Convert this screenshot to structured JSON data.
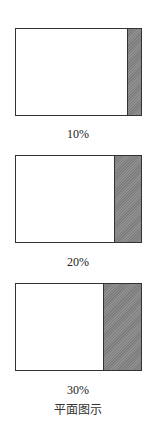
{
  "figure": {
    "caption": "平面图示",
    "panels": [
      {
        "label": "10%",
        "percent": 10
      },
      {
        "label": "20%",
        "percent": 20
      },
      {
        "label": "30%",
        "percent": 30
      }
    ],
    "colors": {
      "border": "#333333",
      "shade": "#8a8a8a",
      "background": "#ffffff"
    }
  }
}
